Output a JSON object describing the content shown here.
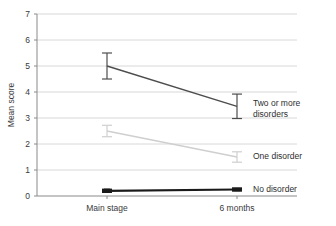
{
  "chart_data": {
    "type": "line",
    "title": "",
    "xlabel": "",
    "ylabel": "Mean score",
    "categories": [
      "Main stage",
      "6 months"
    ],
    "ylim": [
      0,
      7
    ],
    "yticks": [
      0,
      1,
      2,
      3,
      4,
      5,
      6,
      7
    ],
    "ytick_labels": [
      "0",
      "1",
      "2",
      "3",
      "4",
      "5",
      "6",
      "7"
    ],
    "grid": true,
    "legend_position": "right-inline",
    "series": [
      {
        "name": "Two or more disorders",
        "label_line1": "Two or more",
        "label_line2": "disorders",
        "color": "#4d4d4d",
        "values": [
          5.0,
          3.45
        ],
        "errors": [
          0.5,
          0.47
        ],
        "error_low": [
          4.5,
          2.98
        ],
        "error_high": [
          5.5,
          3.92
        ]
      },
      {
        "name": "One disorder",
        "label_line1": "One disorder",
        "label_line2": "",
        "color": "#cfcfcf",
        "values": [
          2.5,
          1.5
        ],
        "errors": [
          0.22,
          0.2
        ],
        "error_low": [
          2.28,
          1.3
        ],
        "error_high": [
          2.72,
          1.7
        ]
      },
      {
        "name": "No disorder",
        "label_line1": "No disorder",
        "label_line2": "",
        "color": "#1a1a1a",
        "values": [
          0.2,
          0.25
        ],
        "errors": [
          0.06,
          0.04
        ],
        "error_low": [
          0.14,
          0.21
        ],
        "error_high": [
          0.26,
          0.29
        ]
      }
    ],
    "axis_color": "#8a8a8a",
    "grid_color": "#d8d8d8",
    "background": "#ffffff"
  }
}
